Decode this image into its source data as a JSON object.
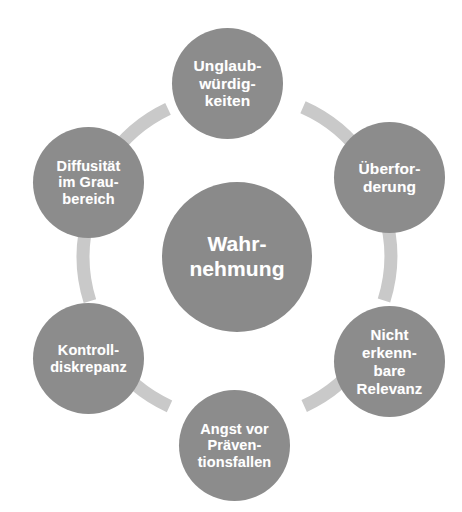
{
  "diagram": {
    "type": "cycle",
    "title_center": "Wahr-\nnehmung",
    "center_node": {
      "id": "center",
      "label": "Wahr-\nnehmung",
      "shape": "circle",
      "fill_color": "#8a8a8a",
      "text_color": "#ffffff"
    },
    "colors": {
      "node_fill": "#8c8c8c",
      "center_fill": "#8a8a8a",
      "node_text": "#ffffff",
      "arc_connector": "#c9c9c9",
      "background": "#ffffff"
    },
    "nodes": [
      {
        "id": "node-0",
        "position": "top",
        "label": "Unglaub-\nwürdig-\nkeiten",
        "shape": "circle",
        "fill_color": "#8c8c8c",
        "text_color": "#ffffff"
      },
      {
        "id": "node-1",
        "position": "upper-right",
        "label": "Überfor-\nderung",
        "shape": "circle",
        "fill_color": "#8c8c8c",
        "text_color": "#ffffff"
      },
      {
        "id": "node-2",
        "position": "lower-right",
        "label": "Nicht\nerkenn-\nbare\nRelevanz",
        "shape": "circle",
        "fill_color": "#8c8c8c",
        "text_color": "#ffffff"
      },
      {
        "id": "node-3",
        "position": "bottom",
        "label": "Angst vor\nPräven-\ntionsfallen",
        "shape": "circle",
        "fill_color": "#8c8c8c",
        "text_color": "#ffffff"
      },
      {
        "id": "node-4",
        "position": "lower-left",
        "label": "Kontroll-\ndiskrepanz",
        "shape": "circle",
        "fill_color": "#8c8c8c",
        "text_color": "#ffffff"
      },
      {
        "id": "node-5",
        "position": "upper-left",
        "label": "Diffusität\nim Grau-\nbereich",
        "shape": "circle",
        "fill_color": "#8c8c8c",
        "text_color": "#ffffff"
      }
    ],
    "connectors": [
      {
        "id": "arc-0",
        "from": "node-5",
        "to": "node-0",
        "style": "arc"
      },
      {
        "id": "arc-1",
        "from": "node-0",
        "to": "node-1",
        "style": "arc"
      },
      {
        "id": "arc-2",
        "from": "node-1",
        "to": "node-2",
        "style": "arc"
      },
      {
        "id": "arc-3",
        "from": "node-2",
        "to": "node-3",
        "style": "arc"
      },
      {
        "id": "arc-4",
        "from": "node-3",
        "to": "node-4",
        "style": "arc"
      },
      {
        "id": "arc-5",
        "from": "node-4",
        "to": "node-5",
        "style": "arc"
      }
    ]
  }
}
